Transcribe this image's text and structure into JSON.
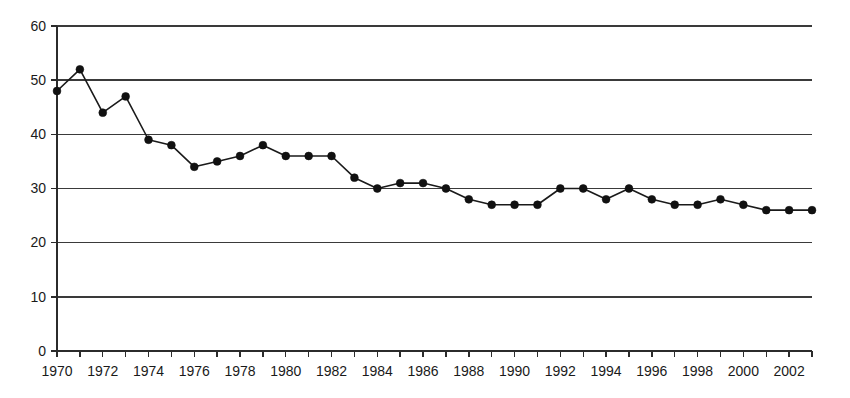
{
  "chart_data": {
    "type": "line",
    "title": "",
    "subtitle": "",
    "xlabel": "",
    "ylabel": "",
    "xlim": [
      1970,
      2003
    ],
    "ylim": [
      0,
      60
    ],
    "ytick_step": 10,
    "xtick_step": 1,
    "xtick_label_step": 2,
    "grid": "horizontal",
    "legend": "none",
    "series_name": "",
    "marker": "filled-circle",
    "line_color": "#1a1a1a",
    "marker_color": "#111111",
    "grid_color": "#3a3a3a",
    "axis_color": "#2b2b2b",
    "x": [
      1970,
      1971,
      1972,
      1973,
      1974,
      1975,
      1976,
      1977,
      1978,
      1979,
      1980,
      1981,
      1982,
      1983,
      1984,
      1985,
      1986,
      1987,
      1988,
      1989,
      1990,
      1991,
      1992,
      1993,
      1994,
      1995,
      1996,
      1997,
      1998,
      1999,
      2000,
      2001,
      2002,
      2003
    ],
    "values": [
      48,
      52,
      44,
      47,
      39,
      38,
      34,
      35,
      36,
      38,
      36,
      36,
      36,
      32,
      30,
      31,
      31,
      30,
      28,
      27,
      27,
      27,
      30,
      30,
      28,
      30,
      28,
      27,
      27,
      28,
      27,
      26,
      26,
      26
    ],
    "ytick_labels": [
      "0",
      "10",
      "20",
      "30",
      "40",
      "50",
      "60"
    ],
    "ytick_values": [
      0,
      10,
      20,
      30,
      40,
      50,
      60
    ],
    "xtick_labels": [
      "1970",
      "1972",
      "1974",
      "1976",
      "1978",
      "1980",
      "1982",
      "1984",
      "1986",
      "1988",
      "1990",
      "1992",
      "1994",
      "1996",
      "1998",
      "2000",
      "2002"
    ],
    "xtick_label_values": [
      1970,
      1972,
      1974,
      1976,
      1978,
      1980,
      1982,
      1984,
      1986,
      1988,
      1990,
      1992,
      1994,
      1996,
      1998,
      2000,
      2002
    ]
  },
  "plot_geometry": {
    "left": 57,
    "right": 812,
    "top": 26,
    "bottom": 351
  }
}
